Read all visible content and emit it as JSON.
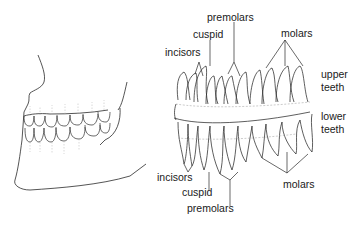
{
  "diagram": {
    "panels": [
      {
        "name": "jaw-profile",
        "description": "Side view of skull jaw with teeth in occlusion"
      },
      {
        "name": "tooth-chart",
        "description": "Upper and lower teeth with roots, labeled by type"
      }
    ],
    "labels": {
      "top_premolars": "premolars",
      "top_cuspid": "cuspid",
      "top_incisors": "incisors",
      "top_molars": "molars",
      "upper_teeth_1": "upper",
      "upper_teeth_2": "teeth",
      "lower_teeth_1": "lower",
      "lower_teeth_2": "teeth",
      "bottom_incisors": "incisors",
      "bottom_cuspid": "cuspid",
      "bottom_premolars": "premolars",
      "bottom_molars": "molars"
    },
    "colors": {
      "line": "#2a2a2a",
      "faint": "#b0b0b0",
      "background": "#ffffff"
    }
  }
}
